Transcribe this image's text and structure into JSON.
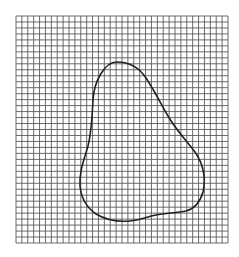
{
  "figure": {
    "background": "#ffffff",
    "grid": {
      "x0": 16,
      "y0": 16,
      "x1": 228,
      "y1": 243,
      "cols": 36,
      "rows": 38,
      "line_color": "#5a5a5a",
      "line_width": 0.9
    },
    "shape": {
      "description": "closed irregular pear-shaped outline drawn over square grid",
      "stroke": "#222222",
      "stroke_width": 1.6,
      "path": "M 117 62 C 128 62, 138 66, 146 78 C 154 90, 160 102, 168 116 C 176 130, 186 140, 195 152 C 204 165, 206 178, 203 192 C 200 203, 193 209, 186 211 C 176 213, 166 213, 156 215 C 146 217, 140 220, 130 221 C 118 222, 106 220, 96 214 C 86 207, 81 197, 80 186 C 79 172, 84 160, 88 146 C 92 130, 92 116, 93 100 C 94 82, 104 62, 117 62 Z"
    }
  }
}
